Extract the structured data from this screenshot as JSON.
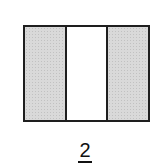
{
  "figure": {
    "type": "fraction-model",
    "total_parts": 3,
    "parts": [
      {
        "index": 0,
        "shaded": true
      },
      {
        "index": 1,
        "shaded": false
      },
      {
        "index": 2,
        "shaded": true
      }
    ],
    "shaded_color": "#d9d9d9",
    "unshaded_color": "#ffffff",
    "border_color": "#1e1e1e"
  },
  "fraction": {
    "numerator": "2",
    "denominator": "3"
  }
}
